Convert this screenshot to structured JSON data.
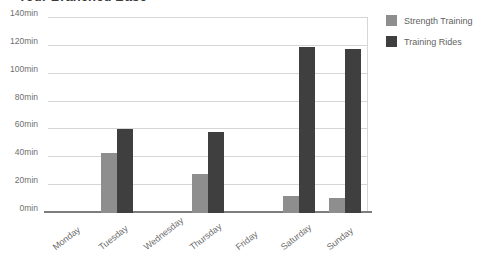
{
  "chart_data": {
    "type": "bar",
    "title": "Your Branched Base",
    "xlabel": "",
    "ylabel": "",
    "ylim": [
      0,
      140
    ],
    "ytick_values": [
      0,
      20,
      40,
      60,
      80,
      100,
      120,
      140
    ],
    "ytick_labels": [
      "0min",
      "20min",
      "40min",
      "60min",
      "80min",
      "100min",
      "120min",
      "140min"
    ],
    "grid": true,
    "legend_position": "right",
    "unit": "min",
    "categories": [
      "Monday",
      "Tuesday",
      "Wednesday",
      "Thursday",
      "Friday",
      "Saturday",
      "Sunday"
    ],
    "series": [
      {
        "name": "Strength Training",
        "color": "#8e8e8e",
        "values": [
          0,
          43,
          0,
          28,
          0,
          12,
          11
        ]
      },
      {
        "name": "Training Rides",
        "color": "#3f3f3f",
        "values": [
          0,
          60,
          0,
          58,
          0,
          119,
          118
        ]
      }
    ]
  },
  "colors": {
    "background": "#ffffff",
    "gridline": "#d6d6d6",
    "axis": "#7d7d7d",
    "tick_text": "#6b6b6b",
    "title_text": "#3a3a3a"
  }
}
